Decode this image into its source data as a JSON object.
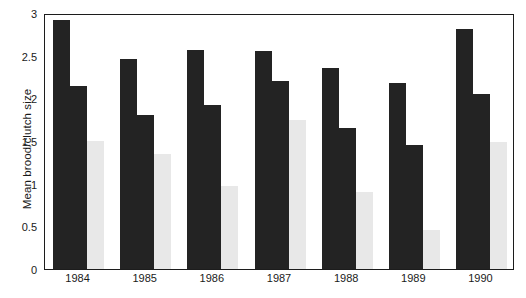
{
  "chart_data": {
    "type": "bar",
    "title": "",
    "xlabel": "",
    "ylabel": "Mean brood/clutch size",
    "categories": [
      "1984",
      "1985",
      "1986",
      "1987",
      "1988",
      "1989",
      "1990"
    ],
    "series": [
      {
        "name": "series-1",
        "color": "#232323",
        "values": [
          2.92,
          2.46,
          2.57,
          2.55,
          2.36,
          2.18,
          2.81
        ]
      },
      {
        "name": "series-2",
        "color": "#232323",
        "values": [
          2.14,
          1.8,
          1.92,
          2.2,
          1.65,
          1.45,
          2.05
        ]
      },
      {
        "name": "series-3",
        "color": "#e8e8e8",
        "values": [
          1.5,
          1.35,
          0.97,
          1.75,
          0.9,
          0.46,
          1.49
        ]
      }
    ],
    "ylim": [
      0,
      3
    ],
    "yticks": [
      0,
      0.5,
      1,
      1.5,
      2,
      2.5,
      3
    ],
    "ytick_labels": [
      "0",
      "0.5",
      "1",
      "1.5",
      "2",
      "2.5",
      "3"
    ],
    "grid": false,
    "legend": "none",
    "frame": true
  }
}
